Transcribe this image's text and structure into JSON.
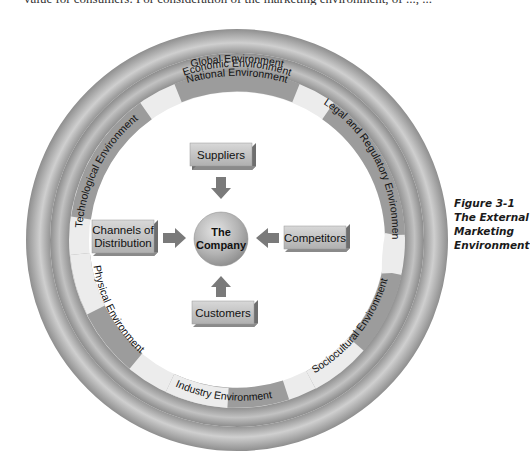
{
  "page": {
    "top_text_fragment": "value for consumers. For consideration of the marketing environment, of ..., ..."
  },
  "diagram": {
    "title": "The External Marketing Environment",
    "center": {
      "label_line1": "The",
      "label_line2": "Company"
    },
    "outer_rings": [
      {
        "label": "Global Environment"
      },
      {
        "label": "National Environment"
      }
    ],
    "inner_ring_segments": [
      {
        "label": "Economic Environment"
      },
      {
        "label": "Legal and Regulatory Environment"
      },
      {
        "label": "Sociocultural Environment"
      },
      {
        "label": "Industry Environment"
      },
      {
        "label": "Physical Environment"
      },
      {
        "label": "Technological Environment"
      }
    ],
    "boxes": {
      "top": {
        "label": "Suppliers"
      },
      "left": {
        "label_line1": "Channels of",
        "label_line2": "Distribution"
      },
      "right": {
        "label": "Competitors"
      },
      "bottom": {
        "label": "Customers"
      }
    },
    "colors": {
      "ring_dark": "#8a8a8a",
      "ring_light": "#c8c8c8",
      "segment_dark": "#9a9a9a",
      "segment_light": "#ececec",
      "box_face": "#c4c4c4",
      "box_side": "#6e6e6e",
      "arrow": "#7a7a7a"
    }
  },
  "caption": {
    "line1": "Figure 3-1",
    "line2": "The External",
    "line3": "Marketing",
    "line4": "Environment"
  }
}
